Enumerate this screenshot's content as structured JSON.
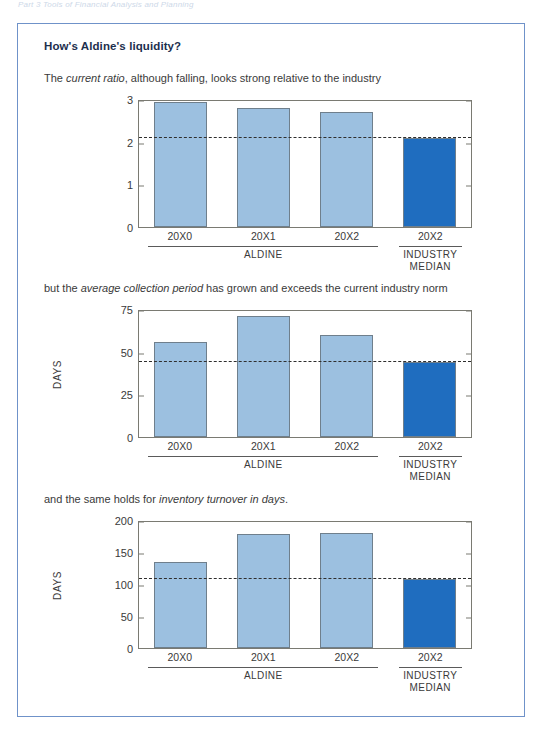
{
  "running_head": "Part 3 Tools of Financial Analysis and Planning",
  "panel": {
    "title": "How's Aldine's liquidity?",
    "border_color": "#6f92c9"
  },
  "colors": {
    "aldine_bar": "#9cc0e0",
    "industry_bar": "#1f6dbf",
    "bar_outline": "#6f7f8c",
    "median_line": "#2e2e2e",
    "frame": "#7a7a72",
    "title": "#1d2f4e"
  },
  "group_labels": {
    "aldine": "ALDINE",
    "industry_line1": "INDUSTRY",
    "industry_line2": "MEDIAN"
  },
  "captions": [
    {
      "pre": "The ",
      "em": "current ratio",
      "post": ", although falling, looks strong relative to the industry"
    },
    {
      "pre": "but the ",
      "em": "average collection period",
      "post": " has grown and exceeds the current industry norm"
    },
    {
      "pre": "and the same holds for ",
      "em": "inventory turnover in days",
      "post": "."
    }
  ],
  "chart_data": [
    {
      "type": "bar",
      "title": "Current ratio",
      "ylabel": "",
      "xlabel": "",
      "categories": [
        "20X0",
        "20X1",
        "20X2",
        "20X2"
      ],
      "series": [
        {
          "name": "Aldine",
          "values": [
            2.92,
            2.78,
            2.7,
            null
          ]
        },
        {
          "name": "Industry median",
          "values": [
            null,
            null,
            null,
            2.08
          ]
        }
      ],
      "values": [
        2.92,
        2.78,
        2.7,
        2.08
      ],
      "bar_kinds": [
        "aldine",
        "aldine",
        "aldine",
        "industry"
      ],
      "ylim": [
        0,
        3
      ],
      "yticks": [
        0,
        1,
        2,
        3
      ],
      "ytick_labels": [
        "0",
        "1",
        "2",
        "3"
      ],
      "median_reference": 2.08,
      "grid": false,
      "legend": "none"
    },
    {
      "type": "bar",
      "title": "Average collection period",
      "ylabel": "DAYS",
      "xlabel": "",
      "categories": [
        "20X0",
        "20X1",
        "20X2",
        "20X2"
      ],
      "series": [
        {
          "name": "Aldine",
          "values": [
            55.5,
            71,
            60,
            null
          ]
        },
        {
          "name": "Industry median",
          "values": [
            null,
            null,
            null,
            44
          ]
        }
      ],
      "values": [
        55.5,
        71,
        60,
        44
      ],
      "bar_kinds": [
        "aldine",
        "aldine",
        "aldine",
        "industry"
      ],
      "ylim": [
        0,
        75
      ],
      "yticks": [
        0,
        25,
        50,
        75
      ],
      "ytick_labels": [
        "0",
        "25",
        "50",
        "75"
      ],
      "median_reference": 44,
      "grid": false,
      "legend": "none"
    },
    {
      "type": "bar",
      "title": "Inventory turnover in days",
      "ylabel": "DAYS",
      "xlabel": "",
      "categories": [
        "20X0",
        "20X1",
        "20X2",
        "20X2"
      ],
      "series": [
        {
          "name": "Aldine",
          "values": [
            134,
            178,
            179,
            null
          ]
        },
        {
          "name": "Industry median",
          "values": [
            null,
            null,
            null,
            108
          ]
        }
      ],
      "values": [
        134,
        178,
        179,
        108
      ],
      "bar_kinds": [
        "aldine",
        "aldine",
        "aldine",
        "industry"
      ],
      "ylim": [
        0,
        200
      ],
      "yticks": [
        0,
        50,
        100,
        150,
        200
      ],
      "ytick_labels": [
        "0",
        "50",
        "100",
        "150",
        "200"
      ],
      "median_reference": 108,
      "grid": false,
      "legend": "none"
    }
  ]
}
